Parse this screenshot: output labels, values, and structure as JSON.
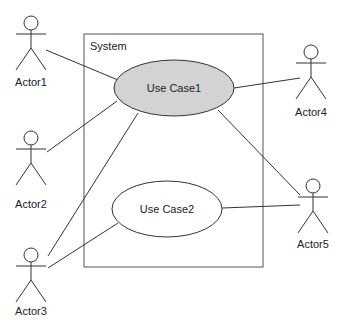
{
  "diagram": {
    "type": "uml-use-case",
    "system": {
      "label": "System"
    },
    "use_cases": [
      {
        "id": "uc1",
        "label": "Use Case1",
        "fill": "#d3d3d3"
      },
      {
        "id": "uc2",
        "label": "Use Case2",
        "fill": "#ffffff"
      }
    ],
    "actors": [
      {
        "id": "a1",
        "label": "Actor1"
      },
      {
        "id": "a2",
        "label": "Actor2"
      },
      {
        "id": "a3",
        "label": "Actor3"
      },
      {
        "id": "a4",
        "label": "Actor4"
      },
      {
        "id": "a5",
        "label": "Actor5"
      }
    ],
    "associations": [
      {
        "from": "a1",
        "to": "uc1"
      },
      {
        "from": "a2",
        "to": "uc1"
      },
      {
        "from": "a3",
        "to": "uc1"
      },
      {
        "from": "a3",
        "to": "uc2"
      },
      {
        "from": "a4",
        "to": "uc1"
      },
      {
        "from": "a5",
        "to": "uc1"
      },
      {
        "from": "a5",
        "to": "uc2"
      }
    ]
  }
}
